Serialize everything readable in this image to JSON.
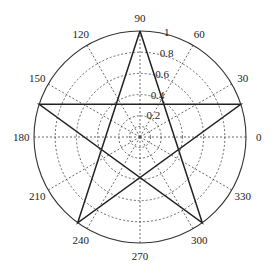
{
  "chart_data": {
    "type": "polar-line",
    "title": "",
    "rlim": [
      0,
      1
    ],
    "r_ticks": [
      0.2,
      0.4,
      0.6,
      0.8,
      1
    ],
    "r_tick_labels": [
      "0.2",
      "0.4",
      "0.6",
      "0.8",
      "1"
    ],
    "theta_ticks_deg": [
      0,
      30,
      60,
      90,
      120,
      150,
      180,
      210,
      240,
      270,
      300,
      330
    ],
    "theta_tick_labels": [
      "0",
      "30",
      "60",
      "90",
      "120",
      "150",
      "180",
      "210",
      "240",
      "270",
      "300",
      "330"
    ],
    "grid": true,
    "legend": null,
    "series": [
      {
        "name": "pentagram",
        "color": "#222222",
        "theta_deg": [
          90,
          234,
          18,
          162,
          306,
          90
        ],
        "r": [
          1,
          1,
          1,
          1,
          1,
          1
        ]
      }
    ]
  }
}
